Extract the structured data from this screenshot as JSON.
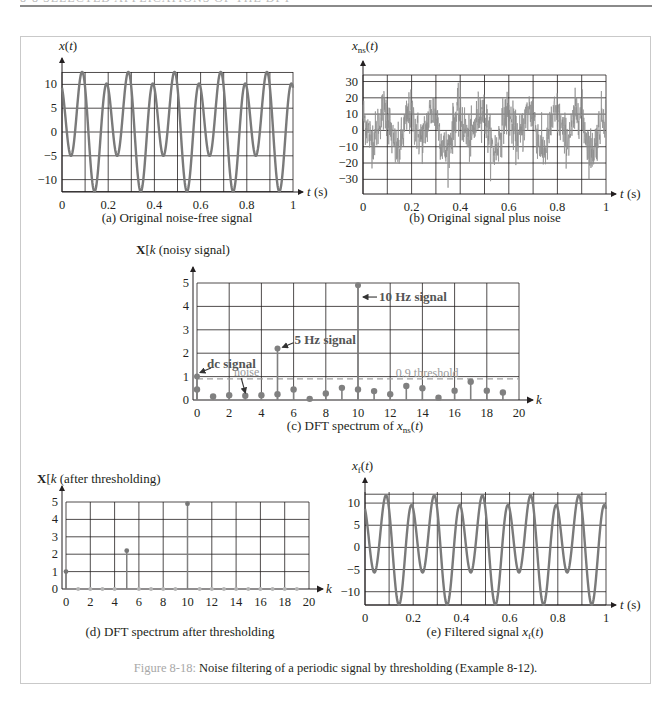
{
  "page": {
    "header_text": "8-8  SELECTED APPLICATIONS OF THE DFT",
    "figure_caption_number": "Figure 8-18:",
    "figure_caption_text": " Noise filtering of a periodic signal by thresholding (Example 8-12)."
  },
  "chart_data": [
    {
      "id": "a",
      "type": "line",
      "title": "(a)  Original noise-free signal",
      "ylabel": "x(t)",
      "xlabel": "t (s)",
      "xlim": [
        0,
        1
      ],
      "ylim": [
        -12.6,
        12.6
      ],
      "xticks": [
        0,
        0.2,
        0.4,
        0.6,
        0.8,
        1
      ],
      "xtick_labels": [
        "0",
        "0.2",
        "0.4",
        "0.6",
        "0.8",
        "1"
      ],
      "yticks": [
        10,
        5,
        0,
        -5,
        -10
      ],
      "ytick_labels": [
        "10",
        "5",
        "0",
        "−5",
        "−10"
      ],
      "xgrid": [
        0,
        0.1,
        0.2,
        0.3,
        0.4,
        0.5,
        0.6,
        0.7,
        0.8,
        0.9,
        1
      ],
      "ygrid": [
        12.5,
        10,
        5,
        0,
        -5,
        -10,
        -12.5
      ],
      "grid": true,
      "signal_model": {
        "dc": 1.25,
        "amp_10hz": 10,
        "peak_time_10hz": 0.09,
        "amp_5hz": 3.95,
        "phase_5hz": 1.249
      },
      "peaks": [
        12.5,
        10
      ],
      "troughs": [
        -5,
        -12.5
      ],
      "color": "#7a7a7a"
    },
    {
      "id": "b",
      "type": "line",
      "title": "(b)  Original signal plus noise",
      "ylabel": "x_ns(t)",
      "xlabel": "t (s)",
      "xlim": [
        0,
        1
      ],
      "ylim": [
        -39,
        34
      ],
      "xticks": [
        0,
        0.2,
        0.4,
        0.6,
        0.8,
        1
      ],
      "xtick_labels": [
        "0",
        "0.2",
        "0.4",
        "0.6",
        "0.8",
        "1"
      ],
      "yticks": [
        30,
        20,
        10,
        0,
        -10,
        -20,
        -30
      ],
      "ytick_labels": [
        "30",
        "20",
        "10",
        "0",
        "−10",
        "−20",
        "−30"
      ],
      "xgrid": [
        0,
        0.1,
        0.2,
        0.3,
        0.4,
        0.5,
        0.6,
        0.7,
        0.8,
        0.9,
        1
      ],
      "ygrid": [
        34,
        30,
        20,
        10,
        0,
        -10,
        -20,
        -30
      ],
      "grid": true,
      "noise_std": 7,
      "color": "#8c8c8c"
    },
    {
      "id": "c",
      "type": "stem",
      "title": "(c)  DFT spectrum of x_ns(t)",
      "ylabel": "X[k] (noisy signal)",
      "xlabel": "k",
      "xlim": [
        0,
        20
      ],
      "ylim": [
        0,
        5
      ],
      "xticks": [
        0,
        2,
        4,
        6,
        8,
        10,
        12,
        14,
        16,
        18,
        20
      ],
      "yticks": [
        0,
        1,
        2,
        3,
        4,
        5
      ],
      "grid": true,
      "k": [
        0,
        1,
        2,
        3,
        4,
        5,
        6,
        7,
        8,
        9,
        10,
        11,
        12,
        13,
        14,
        15,
        16,
        17,
        18,
        19
      ],
      "noise_values": [
        0.45,
        0.15,
        0.2,
        0.18,
        0.2,
        0.25,
        0.45,
        0.05,
        0.28,
        0.52,
        0.45,
        0.38,
        0.25,
        0.6,
        0.5,
        0.1,
        0.4,
        0.78,
        0.4,
        0.32
      ],
      "signal_values": [
        {
          "k": 0,
          "value": 1.0
        },
        {
          "k": 5,
          "value": 2.2
        },
        {
          "k": 10,
          "value": 4.9
        }
      ],
      "threshold": 0.9,
      "annotations": [
        {
          "text": "dc signal",
          "k": 0,
          "value": 1.0
        },
        {
          "text": "5 Hz signal",
          "k": 5,
          "value": 2.2
        },
        {
          "text": "10 Hz signal",
          "k": 10,
          "value": 4.9
        },
        {
          "text": "noise",
          "k": 3,
          "value": 0.18
        },
        {
          "text": "0.9 threshold",
          "k": 14,
          "value": 0.9
        }
      ],
      "color": "#808080"
    },
    {
      "id": "d",
      "type": "stem",
      "title": "(d)  DFT spectrum after thresholding",
      "ylabel": "X[k] (after thresholding)",
      "xlabel": "k",
      "xlim": [
        0,
        20
      ],
      "ylim": [
        0,
        5
      ],
      "xticks": [
        0,
        2,
        4,
        6,
        8,
        10,
        12,
        14,
        16,
        18,
        20
      ],
      "yticks": [
        0,
        1,
        2,
        3,
        4,
        5
      ],
      "grid": true,
      "k": [
        0,
        1,
        2,
        3,
        4,
        5,
        6,
        7,
        8,
        9,
        10,
        11,
        12,
        13,
        14,
        15,
        16,
        17,
        18,
        19
      ],
      "values": [
        1.0,
        0,
        0,
        0,
        0,
        2.2,
        0,
        0,
        0,
        0,
        4.9,
        0,
        0,
        0,
        0,
        0,
        0,
        0,
        0,
        0
      ],
      "color": "#808080"
    },
    {
      "id": "e",
      "type": "line",
      "title": "(e)  Filtered signal x_f(t)",
      "ylabel": "x_f(t)",
      "xlabel": "t (s)",
      "xlim": [
        0,
        1
      ],
      "ylim": [
        -13,
        12.5
      ],
      "xticks": [
        0,
        0.2,
        0.4,
        0.6,
        0.8,
        1
      ],
      "xtick_labels": [
        "0",
        "0.2",
        "0.4",
        "0.6",
        "0.8",
        "1"
      ],
      "yticks": [
        10,
        5,
        0,
        -5,
        -10
      ],
      "ytick_labels": [
        "10",
        "5",
        "0",
        "−5",
        "−10"
      ],
      "xgrid": [
        0,
        0.1,
        0.2,
        0.3,
        0.4,
        0.5,
        0.6,
        0.7,
        0.8,
        0.9,
        1
      ],
      "ygrid": [
        12,
        10,
        5,
        0,
        -5,
        -10,
        -13
      ],
      "grid": true,
      "signal_model": {
        "dc": 0.6,
        "amp_10hz": 9.9,
        "peak_time_10hz": 0.09,
        "amp_5hz": 3.8,
        "phase_5hz": 1.28
      },
      "peaks": [
        12,
        10.5
      ],
      "troughs": [
        -5.6,
        -13
      ],
      "color": "#7a7a7a"
    }
  ]
}
